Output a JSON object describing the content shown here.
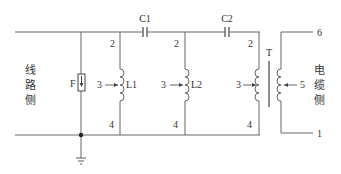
{
  "diagram": {
    "left_label": [
      "线",
      "路",
      "侧"
    ],
    "right_label": [
      "电",
      "缆",
      "侧"
    ],
    "components": {
      "arrester": "F",
      "cap1": "C1",
      "cap2": "C2",
      "ind1": "L1",
      "ind2": "L2",
      "transformer": "T"
    },
    "pins": {
      "l1_top": "2",
      "l1_tap": "3",
      "l1_bot": "4",
      "l2_top": "2",
      "l2_tap": "3",
      "l2_bot": "4",
      "t_top": "2",
      "t_tap": "3",
      "t_bot": "4",
      "sec_tap": "5",
      "sec_top": "6",
      "sec_bot": "1"
    }
  }
}
